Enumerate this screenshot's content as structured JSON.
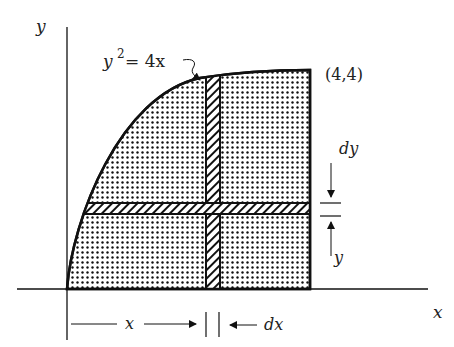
{
  "labels": {
    "y_axis": "y",
    "x_axis": "x",
    "curve_y": "y",
    "curve_exp": "2",
    "curve_rest": " = 4x",
    "point": "(4,4)",
    "dy": "dy",
    "y_dist": "y",
    "x_dist": "x",
    "dx": "dx"
  },
  "geometry": {
    "curve": "y^2 = 4x",
    "region_x_range": [
      0,
      4
    ],
    "region_y_range": [
      0,
      4
    ],
    "corner_point": [
      4,
      4
    ]
  },
  "colors": {
    "ink": "#111111",
    "background": "#ffffff"
  }
}
